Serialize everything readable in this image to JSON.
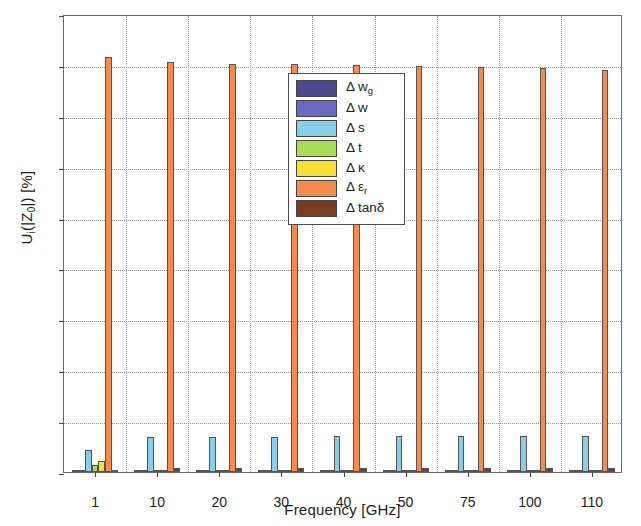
{
  "chart_data": {
    "type": "bar",
    "title": "",
    "xlabel": "Frequency [GHz]",
    "ylabel": "U_i(|Z_0|) [%]",
    "ylabel_parts": {
      "pre": "U",
      "sub1": "i",
      "mid": "(|Z",
      "sub2": "0",
      "post": "|) [%]"
    },
    "categories": [
      "1",
      "10",
      "20",
      "30",
      "40",
      "50",
      "75",
      "100",
      "110"
    ],
    "ylim": [
      0,
      90
    ],
    "yticks": [
      0,
      10,
      20,
      30,
      40,
      50,
      60,
      70,
      80,
      90
    ],
    "grid": "dotted",
    "legend_position": "top-center",
    "series": [
      {
        "name": "Δ w",
        "sub": "g",
        "color": "#4a4a8f",
        "values": [
          0.05,
          0.05,
          0.05,
          0.05,
          0.05,
          0.05,
          0.05,
          0.05,
          0.05
        ]
      },
      {
        "name": "Δ w",
        "sub": "",
        "color": "#6a6ac4",
        "values": [
          0.08,
          0.08,
          0.08,
          0.08,
          0.08,
          0.08,
          0.08,
          0.08,
          0.08
        ]
      },
      {
        "name": "Δ s",
        "sub": "",
        "color": "#87ceeb",
        "values": [
          4.3,
          6.8,
          6.9,
          6.9,
          7.0,
          7.0,
          7.1,
          7.1,
          7.1
        ]
      },
      {
        "name": "Δ t",
        "sub": "",
        "color": "#a8dc52",
        "values": [
          1.3,
          0.1,
          0.1,
          0.1,
          0.1,
          0.1,
          0.1,
          0.1,
          0.1
        ]
      },
      {
        "name": "Δ κ",
        "sub": "",
        "color": "#f7e033",
        "values": [
          2.2,
          0.1,
          0.1,
          0.1,
          0.1,
          0.1,
          0.1,
          0.1,
          0.1
        ]
      },
      {
        "name": "Δ ε",
        "sub": "r",
        "color": "#f58a4b",
        "values": [
          81.5,
          80.5,
          80.2,
          80.1,
          79.9,
          79.8,
          79.6,
          79.3,
          79.0
        ]
      },
      {
        "name": "Δ tanδ",
        "sub": "",
        "color": "#7b3b20",
        "values": [
          0.3,
          0.7,
          0.7,
          0.7,
          0.7,
          0.7,
          0.7,
          0.7,
          0.7
        ]
      }
    ]
  }
}
